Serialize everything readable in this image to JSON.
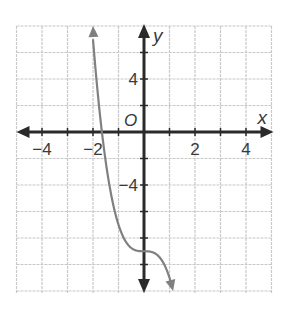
{
  "chart_data": {
    "type": "line",
    "title": "",
    "xlabel": "x",
    "ylabel": "y",
    "origin_label": "O",
    "xlim": [
      -5,
      5
    ],
    "ylim": [
      -12,
      8
    ],
    "grid": true,
    "x_grid_step": 1,
    "y_grid_step": 2,
    "x_tick_labels": [
      "-4",
      "-2",
      "2",
      "4"
    ],
    "x_tick_values": [
      -4,
      -2,
      2,
      4
    ],
    "y_tick_labels": [
      "4",
      "-4"
    ],
    "y_tick_values": [
      4,
      -4
    ],
    "series": [
      {
        "name": "curve",
        "description": "Decreasing cubic-shaped curve with inflection near (0, -9), arrows at both ends",
        "approx_equation": "y = -2x^3 - 9",
        "x": [
          -2.0,
          -1.8,
          -1.65,
          -1.5,
          -1.2,
          -1.0,
          -0.7,
          -0.4,
          0.0,
          0.4,
          0.7,
          1.0,
          1.15
        ],
        "y": [
          7.0,
          2.66,
          0.0,
          -2.25,
          -5.54,
          -7.0,
          -8.31,
          -8.87,
          -9.0,
          -9.13,
          -9.69,
          -11.0,
          -12.04
        ]
      }
    ],
    "colors": {
      "grid": "#c8c8c8",
      "axes": "#2a2a2a",
      "curve": "#808080"
    }
  }
}
